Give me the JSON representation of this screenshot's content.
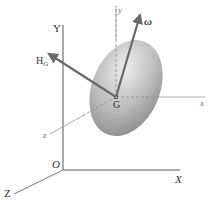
{
  "diagram": {
    "fixed_axes": {
      "origin_label": "O",
      "x_label": "X",
      "y_label": "Y",
      "z_label": "Z"
    },
    "body_axes": {
      "center_label": "G",
      "x_label": "x",
      "y_label": "y",
      "z_label": "z"
    },
    "vectors": {
      "angular_velocity_label": "ω",
      "angular_momentum_label_main": "H",
      "angular_momentum_label_sub": "G"
    },
    "colors": {
      "axis_line": "#555555",
      "dashed_axis": "#8a8a8a",
      "vector": "#6f6f6f",
      "body_light": "#e6e6e6",
      "body_dark": "#8f8f8f"
    }
  }
}
